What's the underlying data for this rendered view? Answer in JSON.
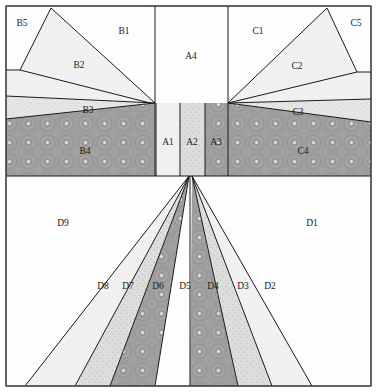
{
  "figure": {
    "width": 377,
    "height": 392,
    "background": "#ffffff",
    "frame_color": "#4a4a4a",
    "edge_color": "#1a1a1a"
  },
  "fills": {
    "white": "#fdfdfd",
    "very_light": "#f0f0f0",
    "light_speckle": "#e3e3e3",
    "mid_speckle": "#dcdcdc",
    "dark_ring": "#9d9d9d",
    "dot_light": "#ededed"
  },
  "regions": [
    {
      "id": "B5",
      "label": "B5",
      "fill": "white",
      "label_x": 22,
      "label_y": 24,
      "points": "6,6 51,8 20,70 6,70"
    },
    {
      "id": "B1",
      "label": "B1",
      "fill": "white",
      "label_x": 124,
      "label_y": 32,
      "points": "51,8 155,6 155,103 150,103 20,70"
    },
    {
      "id": "B2",
      "label": "B2",
      "fill": "very_light",
      "label_x": 79,
      "label_y": 66,
      "points": "51,8 155,103 150,103 6,96 6,70 20,70"
    },
    {
      "id": "B3",
      "label": "B3",
      "fill": "light_speckle",
      "label_x": 88,
      "label_y": 111,
      "points": "6,96 150,103 155,103 6,119"
    },
    {
      "id": "B4",
      "label": "B4",
      "fill": "dark_ring",
      "label_x": 85,
      "label_y": 152,
      "points": "6,119 155,103 155,176 6,176"
    },
    {
      "id": "A4",
      "label": "A4",
      "fill": "white",
      "label_x": 191,
      "label_y": 57,
      "points": "155,6 228,6 228,103 155,103"
    },
    {
      "id": "A1",
      "label": "A1",
      "fill": "very_light",
      "label_x": 168,
      "label_y": 143,
      "points": "156,103 180,103 180,176 156,176"
    },
    {
      "id": "A2",
      "label": "A2",
      "fill": "mid_speckle",
      "label_x": 192,
      "label_y": 143,
      "points": "180,103 205,103 205,176 180,176"
    },
    {
      "id": "A3",
      "label": "A3",
      "fill": "dark_ring",
      "label_x": 216,
      "label_y": 143,
      "points": "205,103 228,103 228,176 205,176"
    },
    {
      "id": "C5",
      "label": "C5",
      "fill": "white",
      "label_x": 356,
      "label_y": 24,
      "points": "327,8 371,6 371,72 357,72"
    },
    {
      "id": "C1",
      "label": "C1",
      "fill": "white",
      "label_x": 258,
      "label_y": 32,
      "points": "228,6 327,8 357,72 228,103"
    },
    {
      "id": "C2",
      "label": "C2",
      "fill": "very_light",
      "label_x": 297,
      "label_y": 67,
      "points": "327,8 357,72 371,72 371,99 228,103"
    },
    {
      "id": "C3",
      "label": "C3",
      "fill": "light_speckle",
      "label_x": 298,
      "label_y": 113,
      "points": "228,103 371,99 371,122 228,103"
    },
    {
      "id": "C4",
      "label": "C4",
      "fill": "dark_ring",
      "label_x": 303,
      "label_y": 152,
      "points": "228,103 371,122 371,176 228,176"
    },
    {
      "id": "D9",
      "label": "D9",
      "fill": "white",
      "label_x": 63,
      "label_y": 224,
      "points": "6,176 189,176 25,386 6,386"
    },
    {
      "id": "D8",
      "label": "D8",
      "fill": "very_light",
      "label_x": 103,
      "label_y": 287,
      "points": "189,176 25,386 75,386"
    },
    {
      "id": "D7",
      "label": "D7",
      "fill": "mid_speckle",
      "label_x": 128,
      "label_y": 287,
      "points": "189,176 75,386 110,386"
    },
    {
      "id": "D6",
      "label": "D6",
      "fill": "dark_ring",
      "label_x": 158,
      "label_y": 287,
      "points": "189,176 110,386 155,386"
    },
    {
      "id": "D5",
      "label": "D5",
      "fill": "white",
      "label_x": 185,
      "label_y": 287,
      "points": "189,176 155,386 190,386"
    },
    {
      "id": "D4",
      "label": "D4",
      "fill": "dark_ring",
      "label_x": 213,
      "label_y": 287,
      "points": "192,176 190,386 238,386"
    },
    {
      "id": "D3",
      "label": "D3",
      "fill": "mid_speckle",
      "label_x": 243,
      "label_y": 287,
      "points": "192,176 238,386 272,386"
    },
    {
      "id": "D2",
      "label": "D2",
      "fill": "very_light",
      "label_x": 270,
      "label_y": 287,
      "points": "192,176 272,386 312,386"
    },
    {
      "id": "D1",
      "label": "D1",
      "fill": "white",
      "label_x": 312,
      "label_y": 224,
      "points": "192,176 371,176 371,386 312,386"
    }
  ],
  "edges": [
    "M6,6 L371,6 L371,386 L6,386 Z",
    "M6,176 L371,176",
    "M155,6 L155,176",
    "M228,6 L228,176",
    "M51,8 L20,70 L6,70",
    "M51,8 L155,103",
    "M20,70 L150,103",
    "M6,96 L155,103",
    "M6,119 L155,103",
    "M327,8 L357,72 L371,72",
    "M327,8 L228,103",
    "M357,72 L228,103",
    "M371,99 L228,103",
    "M371,122 L228,103",
    "M156,103 L156,176",
    "M180,103 L180,176",
    "M205,103 L205,176",
    "M189,176 L25,386",
    "M189,176 L75,386",
    "M189,176 L110,386",
    "M189,176 L155,386",
    "M190,176 L190,386",
    "M192,176 L238,386",
    "M192,176 L272,386",
    "M192,176 L312,386"
  ]
}
